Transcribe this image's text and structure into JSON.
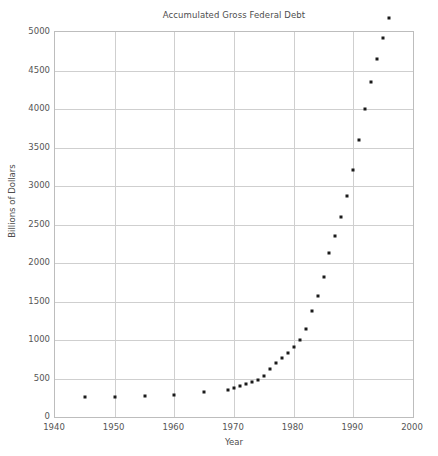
{
  "chart_data": {
    "type": "scatter",
    "title": "Accumulated Gross Federal Debt",
    "xlabel": "Year",
    "ylabel": "Billions of Dollars",
    "xlim": [
      1940,
      2000
    ],
    "ylim": [
      0,
      5000
    ],
    "xticks": [
      1940,
      1950,
      1960,
      1970,
      1980,
      1990,
      2000
    ],
    "xtick_labels": [
      "1940",
      "1950",
      "1960",
      "1970",
      "1980",
      "1990",
      "2000"
    ],
    "yticks": [
      0,
      500,
      1000,
      1500,
      2000,
      2500,
      3000,
      3500,
      4000,
      4500,
      5000
    ],
    "ytick_labels": [
      "0",
      "500",
      "1000",
      "1500",
      "2000",
      "2500",
      "3000",
      "3500",
      "4000",
      "4500",
      "5000"
    ],
    "grid": true,
    "legend": null,
    "marker_color": "#1a1a1a",
    "marker_size": 3,
    "x": [
      1945,
      1950,
      1955,
      1960,
      1965,
      1969,
      1970,
      1971,
      1972,
      1973,
      1974,
      1975,
      1976,
      1977,
      1978,
      1979,
      1980,
      1981,
      1982,
      1983,
      1984,
      1985,
      1986,
      1987,
      1988,
      1989,
      1990,
      1991,
      1992,
      1993,
      1994,
      1995,
      1996
    ],
    "y": [
      260,
      257,
      274,
      291,
      322,
      354,
      371,
      398,
      427,
      458,
      475,
      533,
      620,
      699,
      772,
      827,
      908,
      998,
      1142,
      1377,
      1572,
      1823,
      2125,
      2350,
      2602,
      2868,
      3207,
      3598,
      4002,
      4351,
      4644,
      4921,
      5181
    ],
    "series": [
      {
        "name": "Gross Federal Debt",
        "points": [
          {
            "x": 1945,
            "y": 260
          },
          {
            "x": 1950,
            "y": 257
          },
          {
            "x": 1955,
            "y": 274
          },
          {
            "x": 1960,
            "y": 291
          },
          {
            "x": 1965,
            "y": 322
          },
          {
            "x": 1969,
            "y": 354
          },
          {
            "x": 1970,
            "y": 371
          },
          {
            "x": 1971,
            "y": 398
          },
          {
            "x": 1972,
            "y": 427
          },
          {
            "x": 1973,
            "y": 458
          },
          {
            "x": 1974,
            "y": 475
          },
          {
            "x": 1975,
            "y": 533
          },
          {
            "x": 1976,
            "y": 620
          },
          {
            "x": 1977,
            "y": 699
          },
          {
            "x": 1978,
            "y": 772
          },
          {
            "x": 1979,
            "y": 827
          },
          {
            "x": 1980,
            "y": 908
          },
          {
            "x": 1981,
            "y": 998
          },
          {
            "x": 1982,
            "y": 1142
          },
          {
            "x": 1983,
            "y": 1377
          },
          {
            "x": 1984,
            "y": 1572
          },
          {
            "x": 1985,
            "y": 1823
          },
          {
            "x": 1986,
            "y": 2125
          },
          {
            "x": 1987,
            "y": 2350
          },
          {
            "x": 1988,
            "y": 2602
          },
          {
            "x": 1989,
            "y": 2868
          },
          {
            "x": 1990,
            "y": 3207
          },
          {
            "x": 1991,
            "y": 3598
          },
          {
            "x": 1992,
            "y": 4002
          },
          {
            "x": 1993,
            "y": 4351
          },
          {
            "x": 1994,
            "y": 4644
          },
          {
            "x": 1995,
            "y": 4921
          },
          {
            "x": 1996,
            "y": 5181
          }
        ]
      }
    ]
  }
}
